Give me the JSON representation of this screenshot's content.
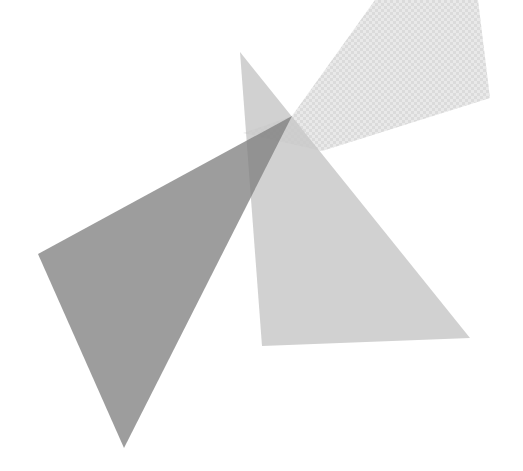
{
  "canvas": {
    "width": 523,
    "height": 471,
    "background": "#ffffff"
  },
  "shapes": [
    {
      "id": "faint-checker-wedge",
      "points": "375,0 478,0 490,98 322,151 243,133 292,116",
      "fill": "#d8d8d8",
      "opacity": 0.35,
      "pattern": "checker"
    },
    {
      "id": "light-triangle",
      "points": "240,52 470,338 262,346",
      "fill": "#b8b8b8",
      "opacity": 0.65
    },
    {
      "id": "dark-triangle",
      "points": "38,254 292,116 124,448",
      "fill": "#8a8a8a",
      "opacity": 0.85
    }
  ],
  "colors": {
    "dark": "#9a9a9a",
    "light": "#cfcfcf",
    "overlap": "#6e6e6e",
    "checker_a": "#f2f2f2",
    "checker_b": "#e4e4e4"
  }
}
